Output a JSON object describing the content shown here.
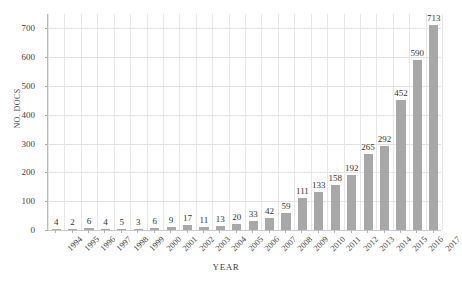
{
  "chart_data": {
    "type": "bar",
    "title": "",
    "xlabel": "YEAR",
    "ylabel": "NO. DOCS",
    "categories": [
      "1994",
      "1995",
      "1996",
      "1997",
      "1998",
      "1999",
      "2000",
      "2001",
      "2002",
      "2003",
      "2004",
      "2005",
      "2006",
      "2007",
      "2008",
      "2009",
      "2010",
      "2011",
      "2012",
      "2013",
      "2014",
      "2015",
      "2016",
      "2017"
    ],
    "values": [
      4,
      2,
      6,
      4,
      5,
      3,
      6,
      9,
      17,
      11,
      13,
      20,
      33,
      42,
      59,
      111,
      133,
      158,
      192,
      265,
      292,
      452,
      590,
      713
    ],
    "ylim": [
      0,
      750
    ],
    "yticks": [
      0,
      100,
      200,
      300,
      400,
      500,
      600,
      700
    ],
    "ytick_labels": [
      "0",
      "100",
      "200",
      "300",
      "400",
      "500",
      "600",
      "700"
    ],
    "grid": "both",
    "legend": "none",
    "data_labels": true,
    "bar_color": "#a8a8a8",
    "grid_color": "#e2e2e2",
    "axis_color": "#b9b9b9",
    "text_color": "#3f3f3f"
  }
}
